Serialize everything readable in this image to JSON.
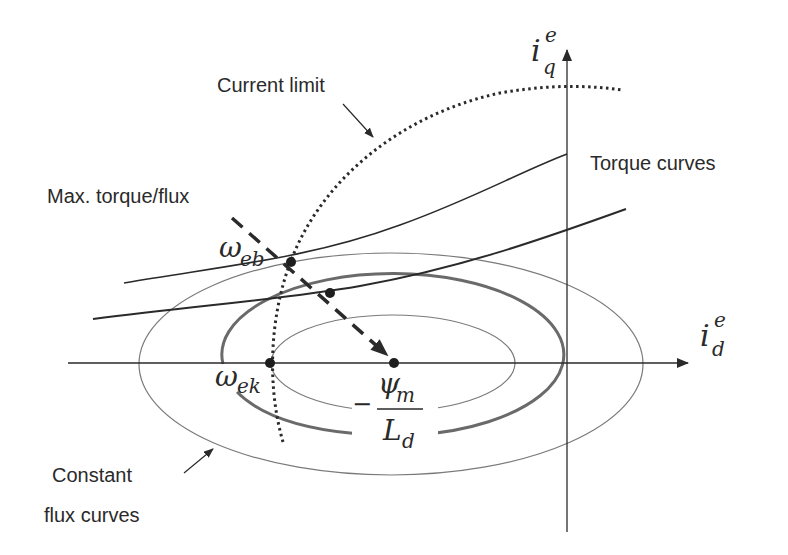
{
  "diagram": {
    "labels": {
      "current_limit": "Current limit",
      "torque_curves": "Torque curves",
      "max_torque_flux": "Max. torque/flux",
      "constant_flux_1": "Constant",
      "constant_flux_2": "flux curves"
    },
    "axes": {
      "x_symbol": "i",
      "x_sub": "d",
      "x_sup": "e",
      "y_symbol": "i",
      "y_sub": "q",
      "y_sup": "e"
    },
    "points": {
      "omega_eb": {
        "symbol": "ω",
        "sub": "eb"
      },
      "omega_ek": {
        "symbol": "ω",
        "sub": "ek"
      },
      "center": {
        "minus": "−",
        "numerator_symbol": "ψ",
        "numerator_sub": "m",
        "denominator_symbol": "L",
        "denominator_sub": "d"
      }
    },
    "colors": {
      "line": "#2a2a2a",
      "thin_ellipse": "#7a7a7a",
      "thick_ellipse": "#6a6a6a",
      "background": "#ffffff"
    }
  }
}
